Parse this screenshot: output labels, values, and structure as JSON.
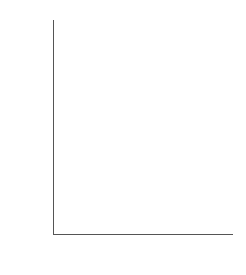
{
  "chart_data": {
    "type": "scatter",
    "title": "",
    "xlabel": "λ",
    "ylabel": "Power: per cent significant",
    "y_scale": "probit (normal probability)",
    "xlim": [
      -2.2,
      0.55
    ],
    "ylim": [
      0.6,
      99.8
    ],
    "grid": false,
    "legend": "none",
    "x_ticks": [
      {
        "value": -2.0,
        "label": "−2.0",
        "major": true
      },
      {
        "value": -1.8,
        "label": "",
        "major": false
      },
      {
        "value": -1.6,
        "label": "−1.6",
        "major": true
      },
      {
        "value": -1.4,
        "label": "",
        "major": false
      },
      {
        "value": -1.2,
        "label": "−1.2",
        "major": true
      },
      {
        "value": -1.0,
        "label": "",
        "major": false
      },
      {
        "value": -0.8,
        "label": "−0.8",
        "major": true
      },
      {
        "value": -0.6,
        "label": "",
        "major": false
      },
      {
        "value": -0.4,
        "label": "−0.4",
        "major": true
      },
      {
        "value": -0.2,
        "label": "",
        "major": false
      },
      {
        "value": 0.0,
        "label": "0",
        "major": true
      },
      {
        "value": 0.2,
        "label": "",
        "major": false
      },
      {
        "value": 0.4,
        "label": "0.4",
        "major": true
      }
    ],
    "y_ticks": [
      {
        "value": 99,
        "label": "99"
      },
      {
        "value": 96,
        "label": "96"
      },
      {
        "value": 90,
        "label": "90"
      },
      {
        "value": 80,
        "label": "80"
      },
      {
        "value": 50,
        "label": "50"
      },
      {
        "value": 20,
        "label": "20"
      },
      {
        "value": 10,
        "label": "10"
      },
      {
        "value": 4,
        "label": "4"
      },
      {
        "value": 1,
        "label": "1"
      }
    ],
    "series": [
      {
        "name": "circle",
        "marker": "circle",
        "points": [
          {
            "x": -2.0,
            "y": 92.0
          },
          {
            "x": -1.8,
            "y": 79.0
          },
          {
            "x": -1.6,
            "y": 53.0
          },
          {
            "x": -1.4,
            "y": 30.0
          },
          {
            "x": -1.2,
            "y": 11.0
          },
          {
            "x": -1.0,
            "y": 6.5
          },
          {
            "x": -0.8,
            "y": 30.0
          },
          {
            "x": -0.6,
            "y": 73.0
          },
          {
            "x": -0.4,
            "y": 94.5
          },
          {
            "x": -0.2,
            "y": 99.6
          }
        ]
      },
      {
        "name": "cross",
        "marker": "cross",
        "points": [
          {
            "x": -2.0,
            "y": 79.5
          },
          {
            "x": -1.8,
            "y": 56.5
          },
          {
            "x": -1.6,
            "y": 35.0
          },
          {
            "x": -1.4,
            "y": 17.0
          },
          {
            "x": -1.2,
            "y": 5.2
          },
          {
            "x": -1.05,
            "y": 2.6
          },
          {
            "x": -1.0,
            "y": 1.6
          },
          {
            "x": -0.8,
            "y": 22.5
          },
          {
            "x": -0.6,
            "y": 63.0
          },
          {
            "x": -0.4,
            "y": 92.0
          },
          {
            "x": -0.2,
            "y": 99.0
          }
        ]
      },
      {
        "name": "triangle",
        "marker": "triangle",
        "points": [
          {
            "x": -2.0,
            "y": 54.0
          },
          {
            "x": -1.8,
            "y": 47.0
          },
          {
            "x": -1.6,
            "y": 34.0
          },
          {
            "x": -1.4,
            "y": 17.0
          },
          {
            "x": -1.2,
            "y": 5.0
          },
          {
            "x": -1.0,
            "y": 2.4
          },
          {
            "x": -0.8,
            "y": 10.0
          },
          {
            "x": -0.6,
            "y": 26.0
          },
          {
            "x": -0.5,
            "y": 51.0
          },
          {
            "x": -0.3,
            "y": 73.0
          },
          {
            "x": -0.1,
            "y": 86.5
          },
          {
            "x": 0.15,
            "y": 91.0
          },
          {
            "x": 0.38,
            "y": 95.5
          }
        ]
      }
    ]
  }
}
